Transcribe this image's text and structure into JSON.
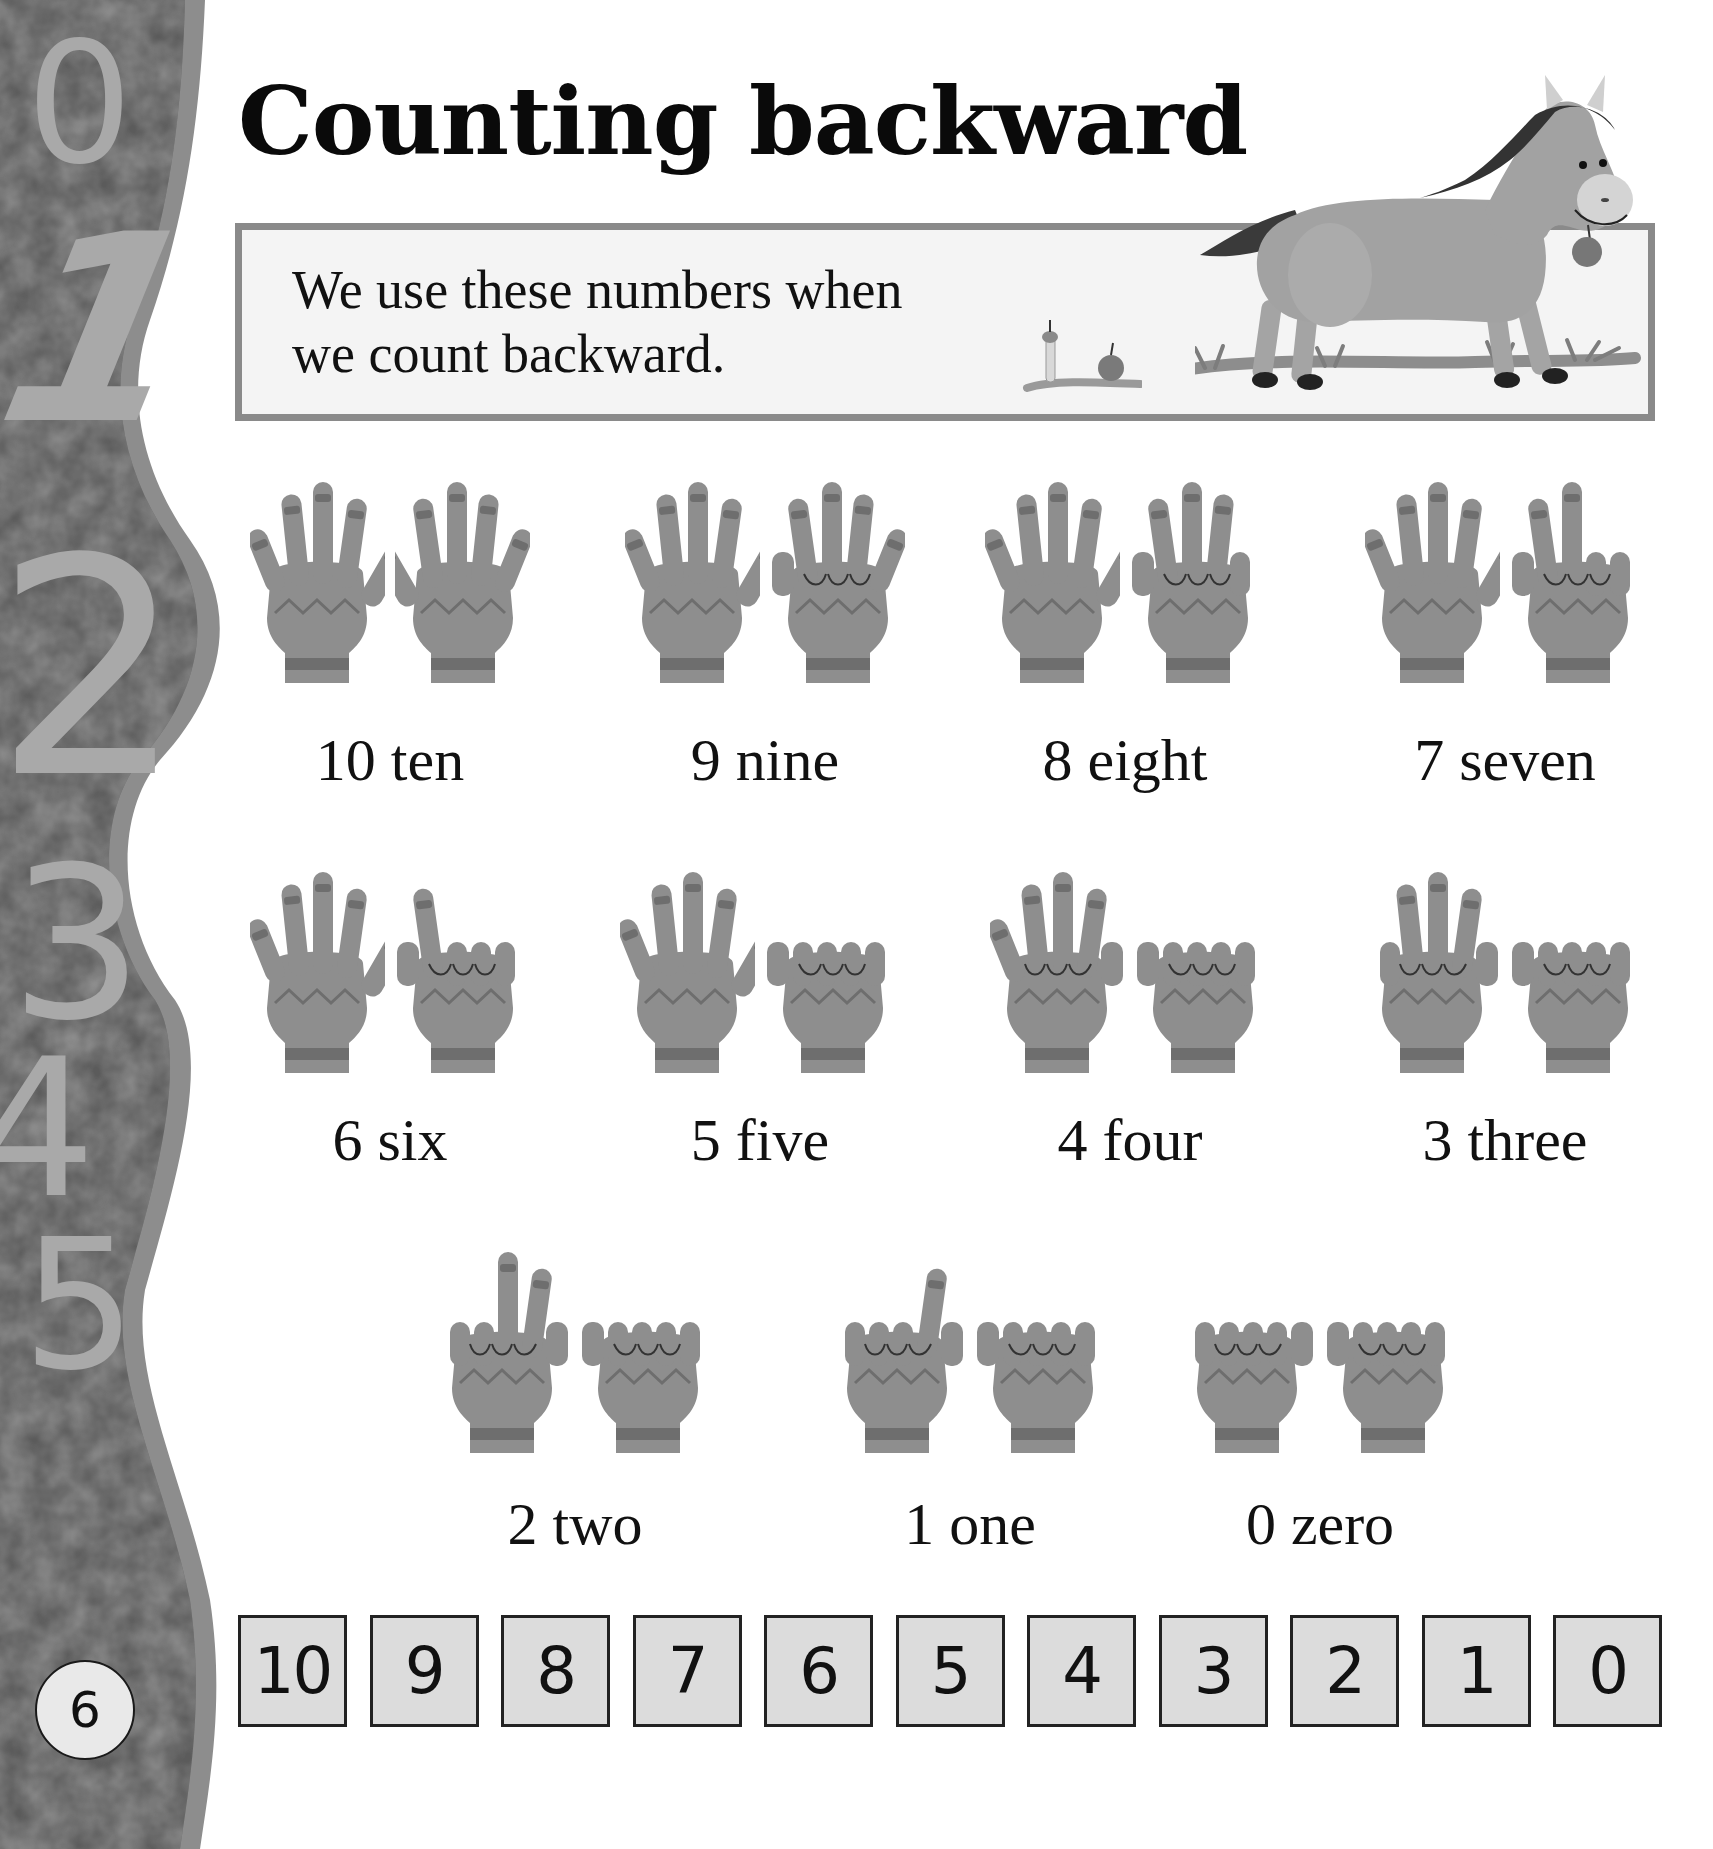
{
  "page": {
    "title": "Counting backward",
    "page_number": "6",
    "colors": {
      "sidebar_dark": "#5b5b5b",
      "sidebar_rim": "#8d8d8d",
      "sidebar_digit": "#a9a9a9",
      "glove": "#8e8e8e",
      "glove_stripe": "#6e6e6e",
      "box_border": "#8a8a8a",
      "strip_fill": "#dcdcdc"
    }
  },
  "sidebar": {
    "digits": [
      "0",
      "1",
      "2",
      "3",
      "4",
      "5"
    ]
  },
  "intro": {
    "line1": "We use these numbers when",
    "line2": "we count backward."
  },
  "illustration": {
    "subject": "horse-icon",
    "details": [
      "apple-icon",
      "apple-core-icon",
      "grass"
    ]
  },
  "counts": [
    {
      "value": 10,
      "label": "10 ten",
      "left_fingers": 5,
      "right_fingers": 5
    },
    {
      "value": 9,
      "label": "9 nine",
      "left_fingers": 5,
      "right_fingers": 4
    },
    {
      "value": 8,
      "label": "8 eight",
      "left_fingers": 5,
      "right_fingers": 3
    },
    {
      "value": 7,
      "label": "7 seven",
      "left_fingers": 5,
      "right_fingers": 2
    },
    {
      "value": 6,
      "label": "6 six",
      "left_fingers": 5,
      "right_fingers": 1
    },
    {
      "value": 5,
      "label": "5 five",
      "left_fingers": 5,
      "right_fingers": 0
    },
    {
      "value": 4,
      "label": "4 four",
      "left_fingers": 4,
      "right_fingers": 0
    },
    {
      "value": 3,
      "label": "3 three",
      "left_fingers": 3,
      "right_fingers": 0
    },
    {
      "value": 2,
      "label": "2 two",
      "left_fingers": 2,
      "right_fingers": 0
    },
    {
      "value": 1,
      "label": "1 one",
      "left_fingers": 1,
      "right_fingers": 0
    },
    {
      "value": 0,
      "label": "0 zero",
      "left_fingers": 0,
      "right_fingers": 0
    }
  ],
  "number_strip": [
    "10",
    "9",
    "8",
    "7",
    "6",
    "5",
    "4",
    "3",
    "2",
    "1",
    "0"
  ]
}
